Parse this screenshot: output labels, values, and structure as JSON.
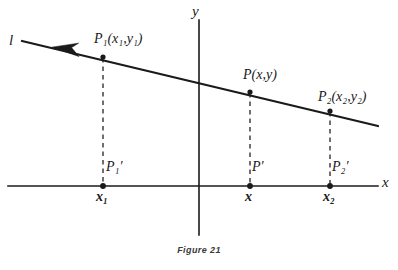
{
  "figure": {
    "caption": "Figure 21",
    "background_color": "#ffffff",
    "ink_color": "#1a1a1a"
  },
  "axes": {
    "y_label": "y",
    "x_label": "x",
    "x_axis": {
      "y": 186,
      "x_start": 8,
      "x_end": 378
    },
    "y_axis": {
      "x": 199,
      "y_start": 20,
      "y_end": 235
    }
  },
  "line": {
    "name": "l",
    "arrow_direction": "left",
    "start": {
      "x": 22,
      "y": 41
    },
    "end": {
      "x": 378,
      "y": 126
    }
  },
  "points": [
    {
      "id": "P1",
      "label_main": "P",
      "label_sub": "1",
      "label_coords": "(x₁,y₁)",
      "x": 103,
      "y": 57,
      "foot_label_main": "P",
      "foot_label_sub": "1",
      "foot_prime": "′",
      "axis_value": "x₁"
    },
    {
      "id": "P",
      "label_main": "P",
      "label_sub": "",
      "label_coords": "(x,y)",
      "x": 250,
      "y": 92,
      "foot_label_main": "P",
      "foot_label_sub": "",
      "foot_prime": "′",
      "axis_value": "x"
    },
    {
      "id": "P2",
      "label_main": "P",
      "label_sub": "2",
      "label_coords": "(x₂,y₂)",
      "x": 330,
      "y": 111,
      "foot_label_main": "P",
      "foot_label_sub": "2",
      "foot_prime": "′",
      "axis_value": "x₂"
    }
  ],
  "labels": {
    "line_name": "l",
    "p1_full": "P₁(x₁,y₁)",
    "p_full": "P(x,y)",
    "p2_full": "P₂(x₂,y₂)",
    "p1_prime": "P₁′",
    "p_prime": "P′",
    "p2_prime": "P₂′",
    "x1": "x₁",
    "x": "x",
    "x2": "x₂"
  }
}
